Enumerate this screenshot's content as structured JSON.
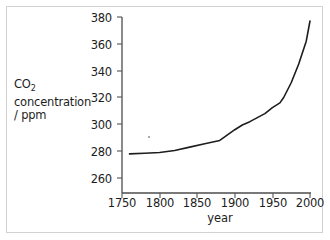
{
  "figure": {
    "background_color": "#ffffff",
    "border_color": "#d2d2d2",
    "ink_color": "#1d1d1d"
  },
  "chart_data": {
    "type": "line",
    "title": "",
    "subtitle": "",
    "xlabel": "year",
    "ylabel": "CO2 concentration / ppm",
    "ylabel_lines": [
      "CO",
      "2",
      " concentration",
      "/ ppm"
    ],
    "ylabel_line1_main": "CO",
    "ylabel_line1_sub": "2",
    "ylabel_line2": "concentration",
    "ylabel_line3": "/ ppm",
    "xlim": [
      1750,
      2000
    ],
    "ylim": [
      255,
      380
    ],
    "xticks": [
      1750,
      1800,
      1850,
      1900,
      1950,
      2000
    ],
    "xtick_labels": [
      "1750",
      "1800",
      "1850",
      "1900",
      "1950",
      "2000"
    ],
    "yticks": [
      260,
      280,
      300,
      320,
      340,
      360,
      380
    ],
    "ytick_labels": [
      "260",
      "280",
      "300",
      "320",
      "340",
      "360",
      "380"
    ],
    "grid": false,
    "legend": false,
    "legend_position": "none",
    "line_color": "#1d1d1d",
    "line_width": 1.6,
    "series": [
      {
        "name": "CO2 concentration",
        "x": [
          1760,
          1780,
          1800,
          1820,
          1840,
          1860,
          1880,
          1900,
          1910,
          1920,
          1930,
          1940,
          1950,
          1960,
          1965,
          1975,
          1985,
          1995,
          2000
        ],
        "values": [
          278,
          278.5,
          279,
          280.5,
          283,
          285.5,
          288,
          296,
          299.5,
          302,
          305,
          308,
          312.5,
          316,
          320,
          331,
          345,
          362,
          377
        ]
      }
    ],
    "annotations": []
  },
  "axes": {
    "y_axis_name": "y-axis",
    "x_axis_name": "x-axis",
    "tick_color": "#555555",
    "axis_color": "#4d4d4d"
  }
}
